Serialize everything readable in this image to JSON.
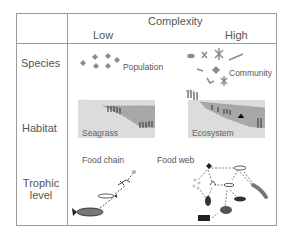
{
  "header": {
    "title": "Complexity",
    "low": "Low",
    "high": "High"
  },
  "rows": [
    {
      "label": "Species",
      "low_label": "Population",
      "high_label": "Community"
    },
    {
      "label": "Habitat",
      "low_label": "Seagrass",
      "high_label": "Ecosystem"
    },
    {
      "label_line1": "Trophic",
      "label_line2": "level",
      "low_label": "Food chain",
      "high_label": "Food web"
    }
  ],
  "colors": {
    "border": "#9a9a9a",
    "text": "#555555",
    "panel_light": "#dcdcdc",
    "panel_water": "#a8a8a8",
    "icon_gray": "#8c8c8c",
    "icon_dark": "#333333"
  }
}
